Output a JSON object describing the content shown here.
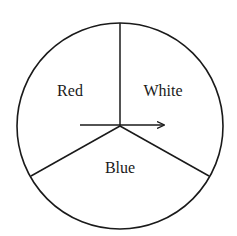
{
  "diagram": {
    "type": "spinner",
    "background": "#ffffff",
    "stroke_color": "#1a1a1a",
    "circle": {
      "cx": 120,
      "cy": 126,
      "r": 103
    },
    "dividers": [
      {
        "name": "divider-top",
        "x2": 120,
        "y2": 23
      },
      {
        "name": "divider-lower-left",
        "x2": 31,
        "y2": 176
      },
      {
        "name": "divider-lower-right",
        "x2": 209,
        "y2": 176
      }
    ],
    "arrow": {
      "x1": 80,
      "y1": 125,
      "x2": 164,
      "y2": 125,
      "direction": "right"
    },
    "sectors": [
      {
        "label": "Red",
        "x": 70,
        "y": 96
      },
      {
        "label": "White",
        "x": 163,
        "y": 96
      },
      {
        "label": "Blue",
        "x": 120,
        "y": 173
      }
    ]
  }
}
